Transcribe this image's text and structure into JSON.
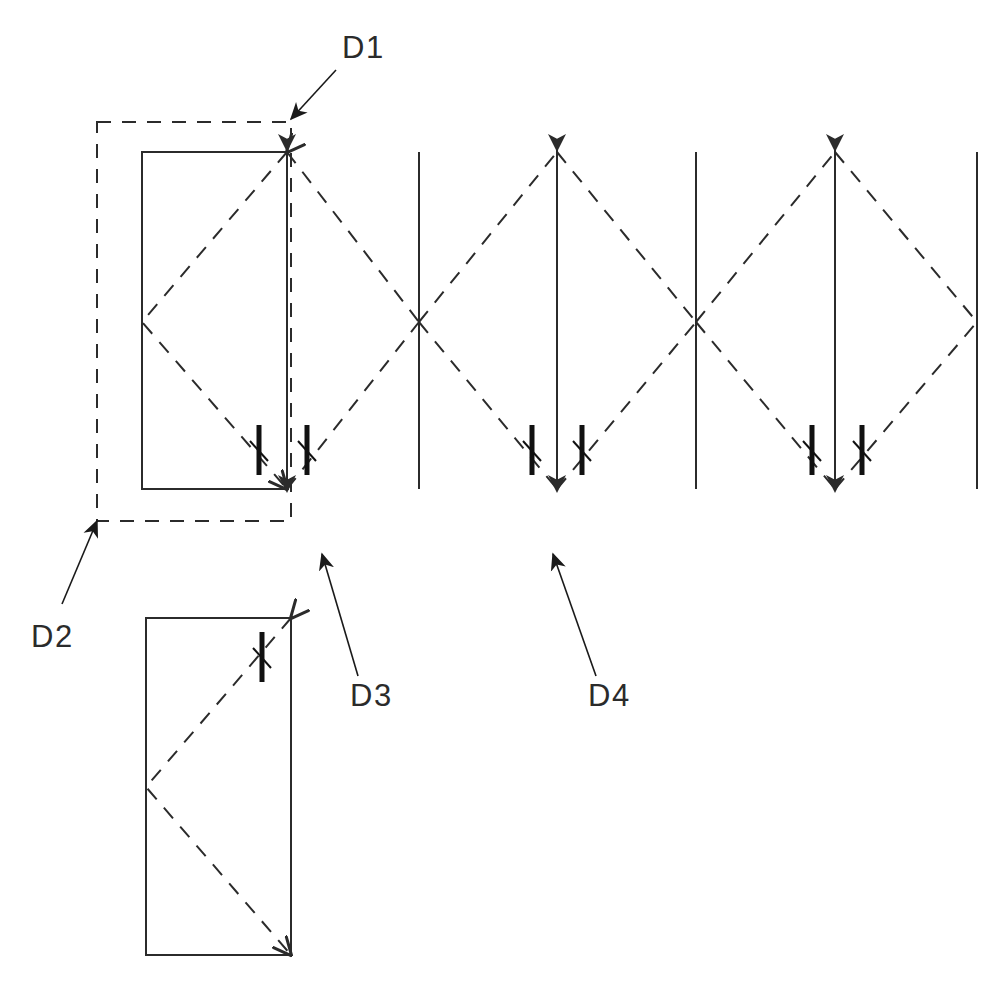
{
  "drawing": {
    "title": "Technical Drawing Detail Callouts",
    "width": 995,
    "height": 986,
    "background_color": "#ffffff",
    "line_color": "#2b2b2b",
    "solid_line_width": 2,
    "dashed_line_width": 2,
    "dash_pattern": "14 11",
    "tick_color": "#111111"
  },
  "labels": [
    {
      "id": "D1",
      "text": "D1",
      "x": 342,
      "y": 58,
      "anchor": "start",
      "leader": {
        "from_x": 336,
        "from_y": 70,
        "to_x": 291,
        "to_y": 119
      },
      "note": "points down-left to top-right corner of dashed outline"
    },
    {
      "id": "D2",
      "text": "D2",
      "x": 31,
      "y": 647,
      "anchor": "start",
      "leader": {
        "from_x": 62,
        "from_y": 604,
        "to_x": 97,
        "to_y": 521
      },
      "note": "points up-right to bottom-left corner of dashed outline"
    },
    {
      "id": "D3",
      "text": "D3",
      "x": 350,
      "y": 706,
      "anchor": "start",
      "leader": {
        "from_x": 358,
        "from_y": 676,
        "to_x": 322,
        "to_y": 554
      },
      "note": "points up to the first dimension tick pair"
    },
    {
      "id": "D4",
      "text": "D4",
      "x": 588,
      "y": 706,
      "anchor": "start",
      "leader": {
        "from_x": 596,
        "from_y": 676,
        "to_x": 553,
        "to_y": 554
      },
      "note": "points up to the second dimension arrow group"
    }
  ],
  "shapes": {
    "dashed_outline": {
      "x": 97,
      "y": 122,
      "width": 194,
      "height": 399
    },
    "upper_rect": {
      "x": 142,
      "y": 152,
      "width": 145,
      "height": 337
    },
    "lower_rect": {
      "x": 146,
      "y": 618,
      "width": 145,
      "height": 337
    }
  },
  "fold_chevrons": [
    {
      "name": "upper-rect-chevron",
      "apex_x": 142,
      "apex_y": 322,
      "top_x": 287,
      "top_y": 152,
      "bottom_x": 287,
      "bottom_y": 489
    },
    {
      "name": "lower-rect-chevron",
      "apex_x": 146,
      "apex_y": 787,
      "top_x": 291,
      "top_y": 618,
      "bottom_x": 291,
      "bottom_y": 955
    }
  ],
  "zigzag": {
    "apex_top_y": 152,
    "apex_bottom_y": 489,
    "cross_y": 322,
    "vertices": [
      {
        "x": 287,
        "type": "top"
      },
      {
        "x": 419,
        "type": "cross"
      },
      {
        "x": 557,
        "type": "top"
      },
      {
        "x": 696,
        "type": "cross"
      },
      {
        "x": 835,
        "type": "top"
      },
      {
        "x": 977,
        "type": "cross"
      }
    ]
  },
  "vertical_lines": [
    {
      "name": "plain-line-1",
      "x": 419,
      "y1": 152,
      "y2": 489,
      "arrows": "none"
    },
    {
      "name": "double-arrow-line-1",
      "x": 557,
      "y1": 150,
      "y2": 491,
      "arrows": "both"
    },
    {
      "name": "plain-line-2",
      "x": 696,
      "y1": 152,
      "y2": 489,
      "arrows": "none"
    },
    {
      "name": "double-arrow-line-2",
      "x": 835,
      "y1": 150,
      "y2": 491,
      "arrows": "both"
    },
    {
      "name": "plain-line-3",
      "x": 977,
      "y1": 152,
      "y2": 489,
      "arrows": "none"
    },
    {
      "name": "upper-rect-right-arrow",
      "x": 287,
      "y1": 150,
      "y2": 491,
      "arrows": "both"
    }
  ],
  "dimension_ticks": [
    {
      "name": "tick-1",
      "x": 259,
      "y_top": 425,
      "y_bottom": 475
    },
    {
      "name": "tick-2",
      "x": 307,
      "y_top": 425,
      "y_bottom": 475
    },
    {
      "name": "tick-3",
      "x": 532,
      "y_top": 425,
      "y_bottom": 475
    },
    {
      "name": "tick-4",
      "x": 582,
      "y_top": 425,
      "y_bottom": 475
    },
    {
      "name": "tick-5",
      "x": 812,
      "y_top": 425,
      "y_bottom": 475
    },
    {
      "name": "tick-6",
      "x": 862,
      "y_top": 425,
      "y_bottom": 475
    },
    {
      "name": "tick-7-lower-rect",
      "x": 262,
      "y_top": 632,
      "y_bottom": 682
    }
  ]
}
